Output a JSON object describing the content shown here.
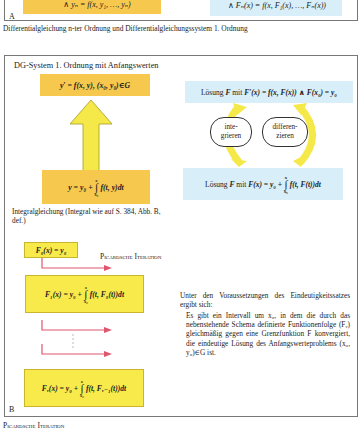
{
  "panel_a": {
    "label": "A",
    "left_box_text": "∧ yₙ    = f(x, y₁, …, yₙ)",
    "right_box_text": "∧ Fₙ(x)    = f(x, F₁(x), …, Fₙ(x))",
    "caption": "Differentialgleichung n-ter Ordnung und Differentialgleichungssystem 1. Ordnung"
  },
  "panel_b": {
    "label": "B",
    "title": "DG-System 1. Ordnung mit Anfangswerten",
    "top_box": "y′ = f(x, y), (x₀, y₀)∈G",
    "integral_box": {
      "prefix": "y = y₀ +",
      "upper": "x",
      "lower": "x₀",
      "suffix": "f(t, y)dt"
    },
    "integral_note": "Integralgleichung (Integral wie auf S. 384, Abb. B, def.)",
    "solution_top": {
      "prefix": "Lösung",
      "F": "F",
      "middle": "mit",
      "formula": "F′(x) = f(x, F(x)) ∧ F(x₀) = y₀"
    },
    "solution_bottom": {
      "prefix": "Lösung",
      "F": "F",
      "middle": "mit",
      "formula": "F(x) = y₀ +",
      "upper": "x",
      "lower": "x₀",
      "suffix": "f(t, F(t))dt"
    },
    "oval_left": [
      "inte-",
      "grieren"
    ],
    "oval_right": [
      "differen-",
      "zieren"
    ],
    "picard_label": "Picardsche Iteration",
    "iteration_boxes": [
      {
        "text": "F₀(x) = y₀"
      },
      {
        "prefix": "F₁(x) = y₀ +",
        "upper": "x",
        "lower": "x₀",
        "suffix": "f(t, F₀(t))dt"
      },
      {
        "prefix": "Fᵥ(x) = y₀ +",
        "upper": "x",
        "lower": "x₀",
        "suffix": "f(t, Fᵥ₋₁(t))dt"
      }
    ],
    "theorem_intro": "Unter den Voraussetzungen des Eindeutigkeitssatzes ergibt sich:",
    "theorem_text": "Es gibt ein Intervall um x₀, in dem die durch das nebenstehende Schema definierte Funktionenfolge (Fᵥ) gleichmäßig gegen eine Grenzfunktion F konvergiert, die eindeutige Lösung des Anfangswerteproblems (x₀, y₀)∈G ist.",
    "caption": "Picardsche Iteration"
  },
  "colors": {
    "orange_box": "#f6c84e",
    "yellow_box": "#f7ea4a",
    "blue_box": "#d8eef8",
    "arrow_yellow": "#f5e94a",
    "arrow_red": "#e0566e",
    "frame": "#777777"
  }
}
